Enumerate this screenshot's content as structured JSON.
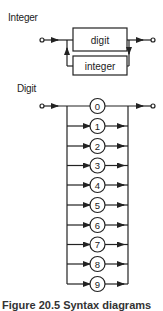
{
  "integer_diagram": {
    "title": "Integer",
    "boxes": [
      {
        "label": "digit"
      },
      {
        "label": "integer"
      }
    ]
  },
  "digit_diagram": {
    "title": "Digit",
    "terminals": [
      "0",
      "1",
      "2",
      "3",
      "4",
      "5",
      "6",
      "7",
      "8",
      "9"
    ]
  },
  "caption": "Figure 20.5 Syntax diagrams",
  "colors": {
    "line": "#222222",
    "background": "#ffffff"
  }
}
